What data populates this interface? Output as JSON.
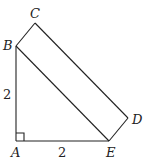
{
  "diagram": {
    "title": "",
    "points": {
      "A": {
        "label": "A",
        "x": 16,
        "y": 141
      },
      "B": {
        "label": "B",
        "x": 16,
        "y": 46
      },
      "C": {
        "label": "C",
        "x": 35,
        "y": 23
      },
      "D": {
        "label": "D",
        "x": 128,
        "y": 118
      },
      "E": {
        "label": "E",
        "x": 109,
        "y": 141
      }
    },
    "measures": {
      "AB": "2",
      "AE": "2"
    },
    "right_angle_at": "A"
  }
}
